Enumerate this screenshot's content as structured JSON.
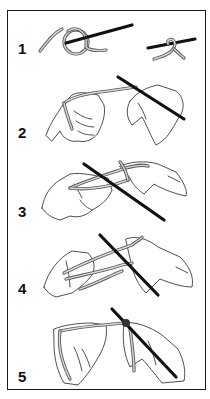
{
  "steps": [
    {
      "number": "1",
      "description": "Slip knot loop formed, then placed on the needle"
    },
    {
      "number": "2",
      "description": "Needle held in right hand, yarn wrapped around left fingers"
    },
    {
      "number": "3",
      "description": "Needle inserted into the loop on the left thumb"
    },
    {
      "number": "4",
      "description": "Yarn caught from the index finger with the needle"
    },
    {
      "number": "5",
      "description": "New stitch drawn through and tightened on the needle"
    }
  ],
  "colors": {
    "outline": "#1a1a1a",
    "needle": "#111111",
    "yarn": "#555555",
    "background": "#ffffff"
  }
}
